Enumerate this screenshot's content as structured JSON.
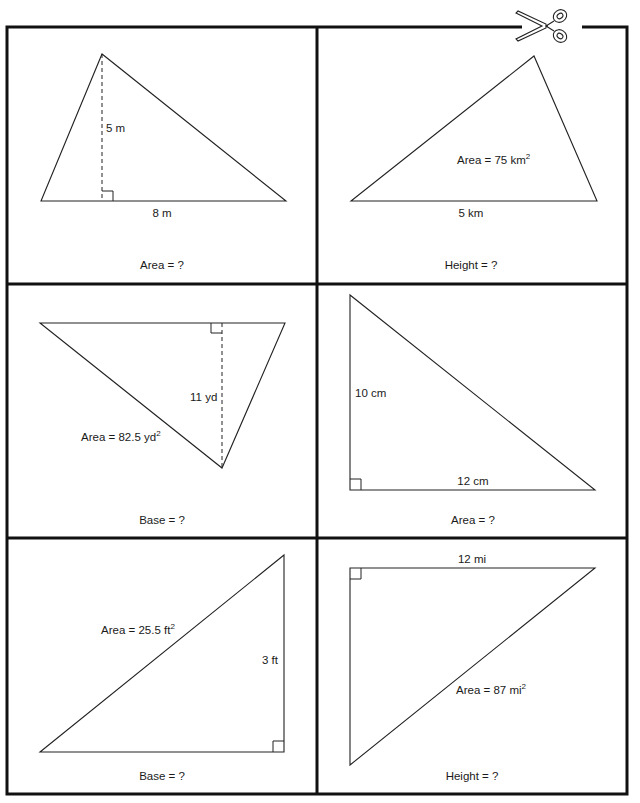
{
  "worksheet": {
    "cut_marker": {
      "icon": "scissors-icon"
    },
    "colors": {
      "border": "#111111",
      "lines": "#222222",
      "text": "#1a1a1a",
      "background": "#ffffff"
    },
    "cards": [
      {
        "id": "card-1",
        "position": "top-left",
        "shape": "acute triangle with dashed altitude",
        "labels": {
          "height": "5 m",
          "base": "8 m"
        },
        "given_area": null,
        "prompt": "Area = ?"
      },
      {
        "id": "card-2",
        "position": "top-right",
        "shape": "scalene triangle",
        "labels": {
          "base": "5 km"
        },
        "given_area": {
          "text": "Area = 75 km",
          "sup": "2"
        },
        "prompt": "Height = ?"
      },
      {
        "id": "card-3",
        "position": "middle-left",
        "shape": "inverted triangle with dashed altitude",
        "labels": {
          "height": "11 yd"
        },
        "given_area": {
          "text": "Area = 82.5 yd",
          "sup": "2"
        },
        "prompt": "Base = ?"
      },
      {
        "id": "card-4",
        "position": "middle-right",
        "shape": "right triangle",
        "labels": {
          "height": "10 cm",
          "base": "12 cm"
        },
        "given_area": null,
        "prompt": "Area = ?"
      },
      {
        "id": "card-5",
        "position": "bottom-left",
        "shape": "right triangle",
        "labels": {
          "height": "3 ft"
        },
        "given_area": {
          "text": "Area = 25.5 ft",
          "sup": "2"
        },
        "prompt": "Base = ?"
      },
      {
        "id": "card-6",
        "position": "bottom-right",
        "shape": "right triangle",
        "labels": {
          "base": "12 mi"
        },
        "given_area": {
          "text": "Area = 87 mi",
          "sup": "2"
        },
        "prompt": "Height = ?"
      }
    ]
  }
}
